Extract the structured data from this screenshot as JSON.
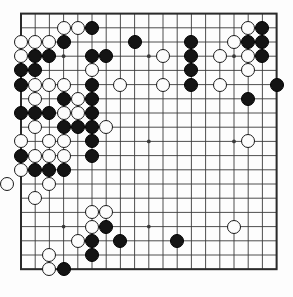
{
  "board": {
    "name": "go-board",
    "size": 19,
    "origin_x": 21.0,
    "origin_y": 13.6,
    "spacing": 14.2,
    "stone_radius": 7.0,
    "line_color": "#3a3a3a",
    "border_color": "#2a2a2a",
    "background_color": "#fdfdfd",
    "black_color": "#141414",
    "white_color": "#fcfcfc",
    "star_points": [
      [
        3,
        3
      ],
      [
        9,
        3
      ],
      [
        15,
        3
      ],
      [
        3,
        9
      ],
      [
        9,
        9
      ],
      [
        15,
        9
      ],
      [
        3,
        15
      ],
      [
        9,
        15
      ],
      [
        15,
        15
      ]
    ],
    "stones": [
      {
        "color": "white",
        "col": 3,
        "row": 1
      },
      {
        "color": "white",
        "col": 4,
        "row": 1
      },
      {
        "color": "black",
        "col": 5,
        "row": 1
      },
      {
        "color": "white",
        "col": 16,
        "row": 1
      },
      {
        "color": "black",
        "col": 17,
        "row": 1
      },
      {
        "color": "white",
        "col": 0,
        "row": 2
      },
      {
        "color": "white",
        "col": 1,
        "row": 2
      },
      {
        "color": "white",
        "col": 2,
        "row": 2
      },
      {
        "color": "black",
        "col": 3,
        "row": 2
      },
      {
        "color": "black",
        "col": 8,
        "row": 2
      },
      {
        "color": "black",
        "col": 12,
        "row": 2
      },
      {
        "color": "white",
        "col": 15,
        "row": 2
      },
      {
        "color": "black",
        "col": 16,
        "row": 2
      },
      {
        "color": "black",
        "col": 17,
        "row": 2
      },
      {
        "color": "white",
        "col": 0,
        "row": 3
      },
      {
        "color": "black",
        "col": 1,
        "row": 3
      },
      {
        "color": "black",
        "col": 2,
        "row": 3
      },
      {
        "color": "black",
        "col": 5,
        "row": 3
      },
      {
        "color": "black",
        "col": 6,
        "row": 3
      },
      {
        "color": "white",
        "col": 10,
        "row": 3
      },
      {
        "color": "black",
        "col": 12,
        "row": 3
      },
      {
        "color": "white",
        "col": 14,
        "row": 3
      },
      {
        "color": "white",
        "col": 16,
        "row": 3
      },
      {
        "color": "black",
        "col": 17,
        "row": 3
      },
      {
        "color": "black",
        "col": 0,
        "row": 4
      },
      {
        "color": "black",
        "col": 1,
        "row": 4
      },
      {
        "color": "white",
        "col": 5,
        "row": 4
      },
      {
        "color": "black",
        "col": 12,
        "row": 4
      },
      {
        "color": "white",
        "col": 16,
        "row": 4
      },
      {
        "color": "black",
        "col": 0,
        "row": 5
      },
      {
        "color": "white",
        "col": 1,
        "row": 5
      },
      {
        "color": "white",
        "col": 2,
        "row": 5
      },
      {
        "color": "white",
        "col": 3,
        "row": 5
      },
      {
        "color": "black",
        "col": 5,
        "row": 5
      },
      {
        "color": "white",
        "col": 7,
        "row": 5
      },
      {
        "color": "white",
        "col": 10,
        "row": 5
      },
      {
        "color": "black",
        "col": 12,
        "row": 5
      },
      {
        "color": "white",
        "col": 14,
        "row": 5
      },
      {
        "color": "black",
        "col": 18,
        "row": 5
      },
      {
        "color": "white",
        "col": 1,
        "row": 6
      },
      {
        "color": "black",
        "col": 3,
        "row": 6
      },
      {
        "color": "white",
        "col": 4,
        "row": 6
      },
      {
        "color": "black",
        "col": 5,
        "row": 6
      },
      {
        "color": "black",
        "col": 16,
        "row": 6
      },
      {
        "color": "black",
        "col": 0,
        "row": 7
      },
      {
        "color": "black",
        "col": 1,
        "row": 7
      },
      {
        "color": "black",
        "col": 2,
        "row": 7
      },
      {
        "color": "white",
        "col": 3,
        "row": 7
      },
      {
        "color": "white",
        "col": 4,
        "row": 7
      },
      {
        "color": "black",
        "col": 5,
        "row": 7
      },
      {
        "color": "white",
        "col": 1,
        "row": 8
      },
      {
        "color": "black",
        "col": 3,
        "row": 8
      },
      {
        "color": "black",
        "col": 4,
        "row": 8
      },
      {
        "color": "black",
        "col": 5,
        "row": 8
      },
      {
        "color": "white",
        "col": 6,
        "row": 8
      },
      {
        "color": "white",
        "col": 0,
        "row": 9
      },
      {
        "color": "white",
        "col": 2,
        "row": 9
      },
      {
        "color": "white",
        "col": 3,
        "row": 9
      },
      {
        "color": "black",
        "col": 5,
        "row": 9
      },
      {
        "color": "white",
        "col": 16,
        "row": 9
      },
      {
        "color": "black",
        "col": 0,
        "row": 10
      },
      {
        "color": "white",
        "col": 1,
        "row": 10
      },
      {
        "color": "white",
        "col": 2,
        "row": 10
      },
      {
        "color": "white",
        "col": 3,
        "row": 10
      },
      {
        "color": "black",
        "col": 5,
        "row": 10
      },
      {
        "color": "white",
        "col": 0,
        "row": 11
      },
      {
        "color": "black",
        "col": 1,
        "row": 11
      },
      {
        "color": "black",
        "col": 2,
        "row": 11
      },
      {
        "color": "black",
        "col": 3,
        "row": 11
      },
      {
        "color": "white",
        "col": -1,
        "row": 12
      },
      {
        "color": "white",
        "col": 2,
        "row": 12
      },
      {
        "color": "white",
        "col": 1,
        "row": 13
      },
      {
        "color": "white",
        "col": 5,
        "row": 14
      },
      {
        "color": "white",
        "col": 6,
        "row": 14
      },
      {
        "color": "white",
        "col": 5,
        "row": 15
      },
      {
        "color": "black",
        "col": 6,
        "row": 15
      },
      {
        "color": "white",
        "col": 15,
        "row": 15
      },
      {
        "color": "white",
        "col": 4,
        "row": 16
      },
      {
        "color": "black",
        "col": 5,
        "row": 16
      },
      {
        "color": "black",
        "col": 7,
        "row": 16
      },
      {
        "color": "black",
        "col": 11,
        "row": 16
      },
      {
        "color": "white",
        "col": 2,
        "row": 17
      },
      {
        "color": "black",
        "col": 5,
        "row": 17
      },
      {
        "color": "white",
        "col": 2,
        "row": 18
      },
      {
        "color": "black",
        "col": 3,
        "row": 18
      }
    ]
  }
}
